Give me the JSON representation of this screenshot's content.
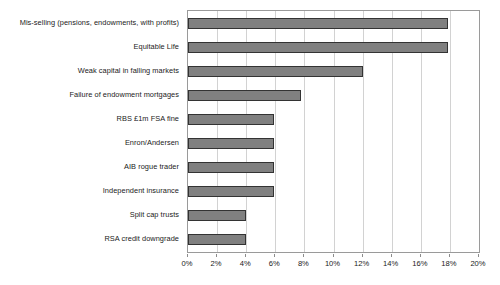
{
  "chart_data": {
    "type": "bar",
    "orientation": "horizontal",
    "title": "",
    "subtitle": "",
    "xlabel": "",
    "ylabel": "",
    "xlim": [
      0,
      20
    ],
    "xticks": [
      0,
      2,
      4,
      6,
      8,
      10,
      12,
      14,
      16,
      18,
      20
    ],
    "xtick_labels": [
      "0%",
      "2%",
      "4%",
      "6%",
      "8%",
      "10%",
      "12%",
      "14%",
      "16%",
      "18%",
      "20%"
    ],
    "grid": "vertical",
    "legend": "none",
    "unit": "%",
    "categories": [
      "Mis-selling (pensions, endowments, with profits)",
      "Equitable Life",
      "Weak capital in falling markets",
      "Failure of endowment mortgages",
      "RBS £1m FSA fine",
      "Enron/Andersen",
      "AIB rogue trader",
      "Independent insurance",
      "Split cap trusts",
      "RSA credit downgrade"
    ],
    "values": [
      17.9,
      17.9,
      12.0,
      7.8,
      5.9,
      5.9,
      5.9,
      5.9,
      4.0,
      4.0
    ],
    "colors": {
      "bar_fill": "#808080",
      "bar_border": "#333333",
      "gridline": "#d2d2d2",
      "axis": "#9a9a9a",
      "text": "#1a1a1a",
      "background": "#ffffff"
    }
  }
}
